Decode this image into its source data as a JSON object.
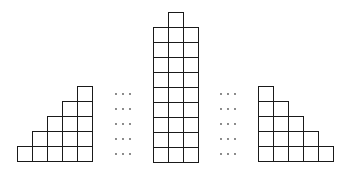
{
  "diagram": {
    "cell_size": 15,
    "stroke_color": "#1a1a1a",
    "background": "#ffffff",
    "shapes": [
      {
        "name": "left-staircase",
        "origin": [
          17,
          86
        ],
        "rows": [
          {
            "start_col": 4,
            "count": 1
          },
          {
            "start_col": 3,
            "count": 2
          },
          {
            "start_col": 2,
            "count": 3
          },
          {
            "start_col": 1,
            "count": 4
          },
          {
            "start_col": 0,
            "count": 5
          }
        ]
      },
      {
        "name": "center-column",
        "origin": [
          153,
          12
        ],
        "rows": [
          {
            "start_col": 1,
            "count": 1
          },
          {
            "start_col": 0,
            "count": 3
          },
          {
            "start_col": 0,
            "count": 3
          },
          {
            "start_col": 0,
            "count": 3
          },
          {
            "start_col": 0,
            "count": 3
          },
          {
            "start_col": 0,
            "count": 3
          },
          {
            "start_col": 0,
            "count": 3
          },
          {
            "start_col": 0,
            "count": 3
          },
          {
            "start_col": 0,
            "count": 3
          },
          {
            "start_col": 0,
            "count": 3
          }
        ]
      },
      {
        "name": "right-staircase",
        "origin": [
          258,
          86
        ],
        "rows": [
          {
            "start_col": 0,
            "count": 1
          },
          {
            "start_col": 0,
            "count": 2
          },
          {
            "start_col": 0,
            "count": 3
          },
          {
            "start_col": 0,
            "count": 4
          },
          {
            "start_col": 0,
            "count": 5
          }
        ]
      }
    ],
    "ellipses": [
      {
        "name": "left-ellipsis",
        "x": [
          116,
          123,
          130
        ],
        "y": [
          94,
          109,
          124,
          139,
          154
        ],
        "symbol": "···"
      },
      {
        "name": "right-ellipsis",
        "x": [
          221,
          228,
          235
        ],
        "y": [
          94,
          109,
          124,
          139,
          154
        ],
        "symbol": "···"
      }
    ]
  }
}
